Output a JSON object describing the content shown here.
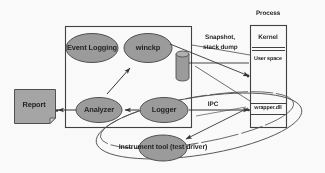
{
  "figure": {
    "kind": "block-diagram",
    "colors": {
      "node_fill": "#9a9a9a",
      "node_stroke": "#4d4d4d",
      "line": "#333333",
      "text": "#1a1a1a",
      "background": "#ffffff",
      "report_fill": "#a5a5a5"
    }
  },
  "nodes": {
    "event_logging": "Event  Logging",
    "winckp": "winckp",
    "analyzer": "Analyzer",
    "logger": "Logger",
    "instrument_tool": "Instrument tool  (test driver)",
    "report": "Report",
    "wrapper_dll": "wrapper.dll"
  },
  "containers": {
    "process": "Process",
    "kernel": "Kernel",
    "user_space": "User space"
  },
  "edge_labels": {
    "snapshot_line1": "Snapshot,",
    "snapshot_line2": "stack dump",
    "ipc": "IPC"
  },
  "icons": {
    "datastore": "cylinder-datastore-icon",
    "report_doc": "document-icon"
  }
}
